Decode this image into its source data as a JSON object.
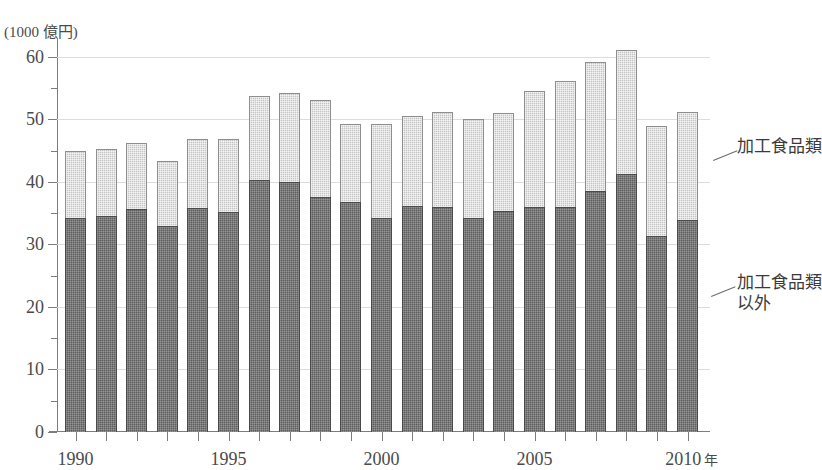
{
  "chart_data": {
    "type": "bar",
    "stacked": true,
    "title": "",
    "xlabel": "年",
    "ylabel": "(1000 億円)",
    "ylim": [
      0,
      63
    ],
    "yticks_major": [
      0,
      10,
      20,
      30,
      40,
      50,
      60
    ],
    "yticks_minor": [
      5,
      15,
      25,
      35,
      45,
      55
    ],
    "grid": true,
    "legend_position": "right-callout",
    "x_tick_labels": [
      {
        "year": 1990,
        "label": "1990"
      },
      {
        "year": 1995,
        "label": "1995"
      },
      {
        "year": 2000,
        "label": "2000"
      },
      {
        "year": 2005,
        "label": "2005"
      },
      {
        "year": 2010,
        "label": "2010"
      }
    ],
    "x_axis_unit": "年",
    "categories": [
      1990,
      1991,
      1992,
      1993,
      1994,
      1995,
      1996,
      1997,
      1998,
      1999,
      2000,
      2001,
      2002,
      2003,
      2004,
      2005,
      2006,
      2007,
      2008,
      2009,
      2010
    ],
    "series": [
      {
        "name": "加工食品類以外",
        "color": "#5e5e5e",
        "values": [
          34.3,
          34.5,
          35.6,
          33.0,
          35.8,
          35.2,
          40.3,
          40.0,
          37.6,
          36.8,
          34.3,
          36.1,
          36.0,
          34.2,
          35.4,
          36.0,
          35.9,
          38.6,
          41.3,
          31.3,
          33.9
        ]
      },
      {
        "name": "加工食品類",
        "color": "#c3c3c3",
        "values": [
          10.7,
          10.8,
          10.6,
          10.4,
          11.0,
          11.6,
          13.5,
          14.2,
          15.5,
          12.5,
          14.9,
          14.4,
          15.1,
          15.9,
          15.6,
          18.5,
          20.3,
          20.5,
          19.8,
          17.7,
          17.2
        ]
      }
    ],
    "totals": [
      45.0,
      45.3,
      46.2,
      43.4,
      46.8,
      46.8,
      53.8,
      54.2,
      53.1,
      49.3,
      49.2,
      50.5,
      51.1,
      50.1,
      51.0,
      54.5,
      56.2,
      59.1,
      61.1,
      49.0,
      51.1
    ]
  },
  "annotations": {
    "top_label": "加工食品類",
    "bottom_label_line1": "加工食品類",
    "bottom_label_line2": "以外"
  },
  "axis": {
    "y_unit_caption": "(1000 億円)"
  }
}
